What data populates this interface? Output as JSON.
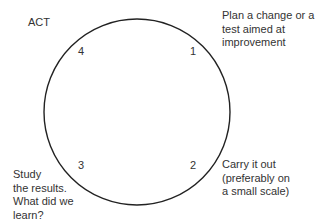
{
  "diagram": {
    "type": "PDSA cycle",
    "stroke_color": "#222222",
    "steps": [
      {
        "number": "1",
        "text": "Plan a change or a\ntest aimed at\nimprovement"
      },
      {
        "number": "2",
        "text": "Carry it out\n(preferably on\na small scale)"
      },
      {
        "number": "3",
        "text": "Study\nthe results.\nWhat did we\nlearn?"
      },
      {
        "number": "4",
        "text": "ACT"
      }
    ]
  }
}
